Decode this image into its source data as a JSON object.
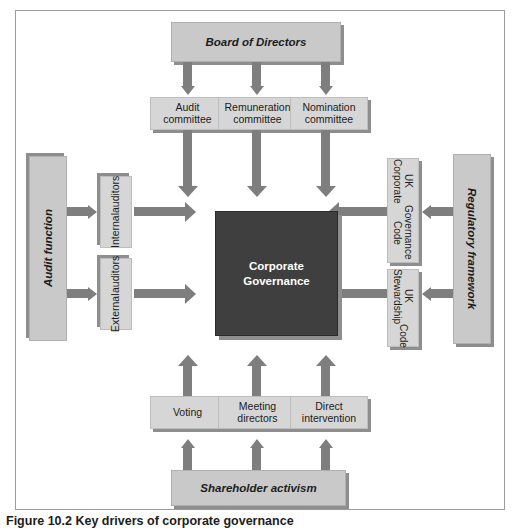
{
  "figure": {
    "caption": "Figure 10.2 Key drivers of corporate governance",
    "frame_border_color": "#9a9aa0"
  },
  "colors": {
    "box_fill": "#c9c9c9",
    "box_fill_light": "#d6d6d6",
    "box_shadow": "#8e8e8e",
    "arrow": "#7e7e7e",
    "core_fill": "#3f3f3f",
    "core_text": "#ffffff"
  },
  "diagram": {
    "core": {
      "label": "Corporate\nGovernance",
      "line1": "Corporate",
      "line2": "Governance"
    },
    "top": {
      "parent": {
        "label": "Board of Directors"
      },
      "children": [
        {
          "line1": "Audit",
          "line2": "committee"
        },
        {
          "line1": "Remuneration",
          "line2": "committee"
        },
        {
          "line1": "Nomination",
          "line2": "committee"
        }
      ]
    },
    "left": {
      "parent": {
        "label": "Audit function"
      },
      "children": [
        {
          "line1": "Internal",
          "line2": "auditors"
        },
        {
          "line1": "External",
          "line2": "auditors"
        }
      ]
    },
    "right": {
      "parent": {
        "label": "Regulatory framework"
      },
      "children": [
        {
          "line1": "UK Corporate",
          "line2": "Governance Code"
        },
        {
          "line1": "UK Stewardship",
          "line2": "Code"
        }
      ]
    },
    "bottom": {
      "parent": {
        "label": "Shareholder activism"
      },
      "children": [
        {
          "line1": "Voting",
          "line2": ""
        },
        {
          "line1": "Meeting",
          "line2": "directors"
        },
        {
          "line1": "Direct",
          "line2": "intervention"
        }
      ]
    }
  }
}
